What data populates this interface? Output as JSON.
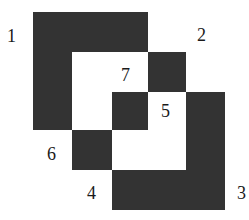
{
  "diagram": {
    "fill_color": "#333333",
    "background": "#ffffff",
    "labels": [
      {
        "id": "1",
        "text": "1",
        "x": 7,
        "y": 26
      },
      {
        "id": "2",
        "text": "2",
        "x": 197,
        "y": 26
      },
      {
        "id": "7",
        "text": "7",
        "x": 119,
        "y": 66
      },
      {
        "id": "5",
        "text": "5",
        "x": 160,
        "y": 101
      },
      {
        "id": "6",
        "text": "6",
        "x": 47,
        "y": 147
      },
      {
        "id": "4",
        "text": "4",
        "x": 86,
        "y": 184
      },
      {
        "id": "3",
        "text": "3",
        "x": 236,
        "y": 184
      }
    ],
    "pieces": [
      {
        "id": "1",
        "desc": "L-shaped piece (top bar and left column)"
      },
      {
        "id": "2",
        "desc": "square"
      },
      {
        "id": "3",
        "desc": "L-shaped piece (right column and bottom bar)"
      },
      {
        "id": "4",
        "desc": "region label near bottom"
      },
      {
        "id": "5",
        "desc": "square"
      },
      {
        "id": "6",
        "desc": "square"
      },
      {
        "id": "7",
        "desc": "inner white region label"
      }
    ]
  }
}
